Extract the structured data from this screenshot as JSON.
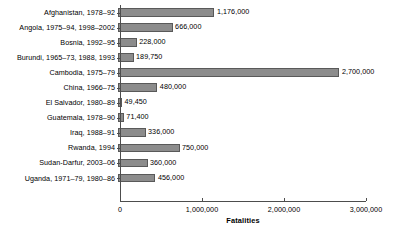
{
  "chart_data": {
    "type": "bar",
    "orientation": "horizontal",
    "title": "",
    "subtitle": "",
    "xlabel": "Fatalities",
    "ylabel": "",
    "xlim": [
      0,
      3000000
    ],
    "grid": false,
    "legend": null,
    "bar_color": "#8c8c8c",
    "bar_edge_color": "#595959",
    "axis_color": "#4d4d4d",
    "xticks": [
      0,
      1000000,
      2000000,
      3000000
    ],
    "xtick_labels": [
      "0",
      "1,000,000",
      "2,000,000",
      "3,000,000"
    ],
    "categories": [
      "Afghanistan, 1978–92",
      "Angola, 1975–94, 1998–2002",
      "Bosnia, 1992–95",
      "Burundi, 1965–73, 1988, 1993",
      "Cambodia, 1975–79",
      "China, 1966–75",
      "El Salvador, 1980–89",
      "Guatemala, 1978–90",
      "Iraq, 1988–91",
      "Rwanda, 1994",
      "Sudan-Darfur, 2003–06",
      "Uganda, 1971–79, 1980–86"
    ],
    "values": [
      1176000,
      666000,
      228000,
      189750,
      2700000,
      480000,
      49450,
      71400,
      336000,
      750000,
      360000,
      456000
    ],
    "value_labels": [
      "1,176,000",
      "666,000",
      "228,000",
      "189,750",
      "2,700,000",
      "480,000",
      "49,450",
      "71,400",
      "336,000",
      "750,000",
      "360,000",
      "456,000"
    ]
  }
}
